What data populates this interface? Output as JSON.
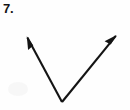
{
  "figure": {
    "problem_number": "7.",
    "type": "angle",
    "colors": {
      "background": "#fefefe",
      "stroke": "#141414",
      "label": "#141414"
    },
    "canvas": {
      "width": 130,
      "height": 110
    },
    "vertex": {
      "label": "",
      "x": 62,
      "y": 102
    },
    "rays": [
      {
        "name": "left-ray",
        "from_x": 62,
        "from_y": 102,
        "to_x": 25,
        "to_y": 33,
        "arrowhead": "true",
        "direction": "up-left"
      },
      {
        "name": "right-ray",
        "from_x": 62,
        "from_y": 102,
        "to_x": 119,
        "to_y": 32,
        "arrowhead": "true",
        "direction": "up-right"
      }
    ],
    "stroke_width": 2.1
  }
}
